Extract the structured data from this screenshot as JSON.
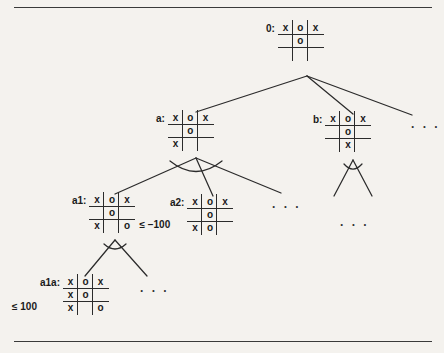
{
  "figure": {
    "background_color": "#f4f2ee",
    "line_color": "#2b2b2b",
    "text_color": "#1a1a1a",
    "ellipsis_text": ". . ."
  },
  "nodes": [
    {
      "id": "root",
      "label": "0:",
      "bound": "",
      "bound_side": "none",
      "cells": [
        "x",
        "o",
        "x",
        "",
        "o",
        "",
        "",
        "",
        ""
      ]
    },
    {
      "id": "a",
      "label": "a:",
      "bound": "",
      "bound_side": "none",
      "cells": [
        "x",
        "o",
        "x",
        "",
        "o",
        "",
        "x",
        "",
        ""
      ]
    },
    {
      "id": "b",
      "label": "b:",
      "bound": "",
      "bound_side": "none",
      "cells": [
        "x",
        "o",
        "x",
        "",
        "o",
        "",
        "",
        "x",
        ""
      ]
    },
    {
      "id": "a1",
      "label": "a1:",
      "bound": "≤ −100",
      "bound_side": "right",
      "cells": [
        "x",
        "o",
        "x",
        "",
        "o",
        "",
        "x",
        "",
        "o"
      ]
    },
    {
      "id": "a2",
      "label": "a2:",
      "bound": "",
      "bound_side": "none",
      "cells": [
        "x",
        "o",
        "x",
        "",
        "o",
        "",
        "x",
        "o",
        ""
      ]
    },
    {
      "id": "a1a",
      "label": "a1a:",
      "bound": "≤ 100",
      "bound_side": "left",
      "cells": [
        "x",
        "o",
        "x",
        "x",
        "o",
        "",
        "x",
        "",
        "o"
      ]
    }
  ],
  "ellipses": [
    {
      "id": "root-more",
      "text": ". . ."
    },
    {
      "id": "a-more",
      "text": ". . ."
    },
    {
      "id": "b-more",
      "text": ". . ."
    },
    {
      "id": "a1-more",
      "text": ". . ."
    }
  ]
}
